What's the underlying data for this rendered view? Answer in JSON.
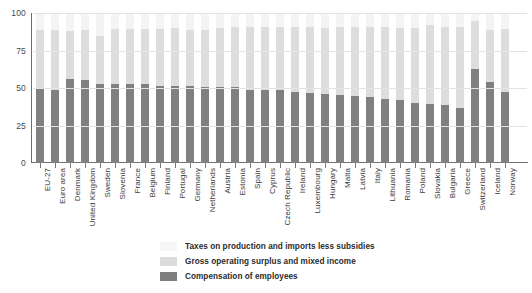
{
  "chart_data": {
    "type": "bar",
    "stacked": true,
    "title": "",
    "xlabel": "",
    "ylabel": "",
    "ylim": [
      0,
      100
    ],
    "yticks": [
      0,
      25,
      50,
      75,
      100
    ],
    "grid": true,
    "legend_position": "bottom",
    "categories": [
      "EU-27",
      "Euro area",
      "Denmark",
      "United Kingdom",
      "Sweden",
      "Slovenia",
      "France",
      "Belgium",
      "Finland",
      "Portugal",
      "Germany",
      "Netherlands",
      "Austria",
      "Estonia",
      "Spain",
      "Cyprus",
      "Czech Republic",
      "Ireland",
      "Luxembourg",
      "Hungary",
      "Malta",
      "Latvia",
      "Italy",
      "Lithuania",
      "Romania",
      "Poland",
      "Slovakia",
      "Bulgaria",
      "Greece",
      "Switzerland",
      "Iceland",
      "Norway"
    ],
    "series": [
      {
        "name": "Compensation of employees",
        "color": "#808080",
        "values": [
          50,
          49,
          56,
          55.5,
          53,
          53,
          53,
          52.5,
          51.5,
          51.5,
          51.5,
          51,
          51,
          50.5,
          49,
          48.5,
          48.5,
          47.5,
          47,
          46,
          45.5,
          44.5,
          44,
          42.5,
          42,
          40,
          39.5,
          39,
          37,
          63,
          54,
          47.5
        ]
      },
      {
        "name": "Gross operating surplus and mixed income",
        "color": "#dddddd",
        "values": [
          38.5,
          39.5,
          32,
          33,
          31.5,
          36.5,
          36.5,
          37,
          38,
          38.5,
          37.5,
          38,
          39,
          40,
          42,
          42,
          42.5,
          43,
          43.5,
          44,
          45,
          46,
          46.5,
          48,
          48,
          50,
          52.5,
          52,
          54,
          32,
          34.5,
          42
        ]
      },
      {
        "name": "Taxes on production and imports less subsidies",
        "color": "#f4f4f4",
        "values": [
          11.5,
          11.5,
          12,
          11.5,
          15.5,
          10.5,
          10.5,
          10.5,
          10.5,
          10,
          11,
          11,
          10,
          9.5,
          9,
          9.5,
          9,
          9.5,
          9.5,
          10,
          9.5,
          9.5,
          9.5,
          9.5,
          10,
          10,
          8,
          9,
          9,
          5,
          11.5,
          10.5
        ]
      }
    ],
    "legend": [
      "Taxes on production and imports less subsidies",
      "Gross operating surplus and mixed income",
      "Compensation of employees"
    ],
    "colors": {
      "taxes": "#f4f4f4",
      "gross_operating_surplus": "#dddddd",
      "compensation": "#808080",
      "gridline": "#e2e2ea",
      "axis": "#6f6f6f",
      "text": "#3a3a3a"
    }
  }
}
